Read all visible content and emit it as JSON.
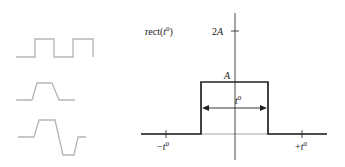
{
  "diagram": {
    "left_waveforms": [
      {
        "name": "square-wave",
        "color": "#b0b0b0"
      },
      {
        "name": "trapezoid-pulse",
        "color": "#b0b0b0"
      },
      {
        "name": "bipolar-trapezoid",
        "color": "#b0b0b0"
      }
    ],
    "plot": {
      "function_label": "rect(",
      "function_var": "t",
      "function_sup": "0",
      "function_close": ")",
      "y_tick_label": "2",
      "y_tick_var": "A",
      "amplitude_label": "A",
      "width_label_var": "t",
      "width_label_sup": "0",
      "x_tick_neg": "−",
      "x_tick_pos": "+",
      "x_tick_var": "t",
      "x_tick_sup": "0",
      "line_color": "#222222",
      "axis_color": "#333333"
    }
  }
}
